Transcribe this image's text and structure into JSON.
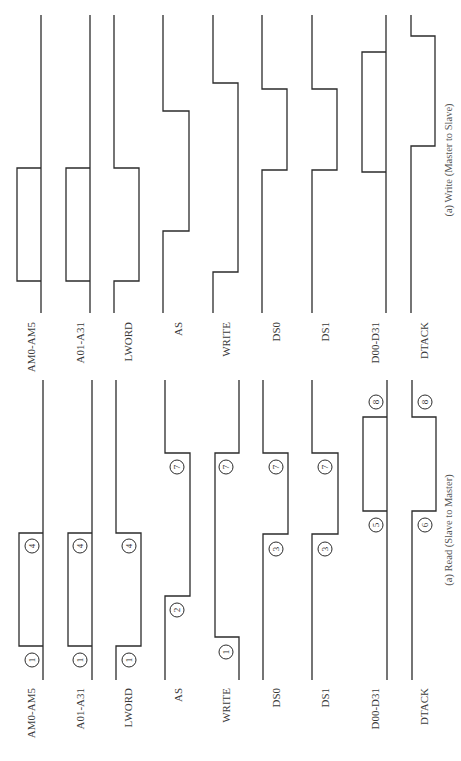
{
  "diagram": {
    "panels": [
      {
        "id": "write",
        "caption": "(a) Write (Master to Slave)",
        "caption_pos": [
          452,
          160
        ],
        "top_y": 15,
        "bottom_y": 313,
        "label_y": 322,
        "signals": [
          {
            "name": "AM0-AM5",
            "kind": "bus",
            "x": 41,
            "dx": -24,
            "segments": [
              [
                168,
                281
              ]
            ],
            "label_x": 31
          },
          {
            "name": "A01-A31",
            "kind": "bus",
            "x": 90,
            "dx": -24,
            "segments": [
              [
                168,
                281
              ]
            ],
            "label_x": 80
          },
          {
            "name": "LWORD",
            "kind": "step",
            "x": 114,
            "dx": 25,
            "segments": [
              [
                168,
                281
              ]
            ],
            "label_x": 128
          },
          {
            "name": "AS",
            "kind": "step",
            "x": 163,
            "dx": 26,
            "segments": [
              [
                111,
                231
              ]
            ],
            "label_x": 178
          },
          {
            "name": "WRITE",
            "kind": "step",
            "x": 213,
            "dx": 25,
            "segments": [
              [
                83,
                272
              ]
            ],
            "label_x": 226
          },
          {
            "name": "DS0",
            "kind": "step",
            "x": 262,
            "dx": 25,
            "segments": [
              [
                89,
                170
              ]
            ],
            "label_x": 276
          },
          {
            "name": "DS1",
            "kind": "step",
            "x": 312,
            "dx": 25,
            "segments": [
              [
                89,
                170
              ]
            ],
            "label_x": 325
          },
          {
            "name": "D00-D31",
            "kind": "bus",
            "x": 386,
            "dx": -24,
            "segments": [
              [
                52,
                172
              ]
            ],
            "label_x": 375
          },
          {
            "name": "DTACK",
            "kind": "step",
            "x": 411,
            "dx": 24,
            "segments": [
              [
                36,
                146
              ]
            ],
            "label_x": 424
          }
        ],
        "markers": []
      },
      {
        "id": "read",
        "caption": "(a) Read (Slave to Master)",
        "caption_pos": [
          452,
          530
        ],
        "top_y": 380,
        "bottom_y": 680,
        "label_y": 688,
        "signals": [
          {
            "name": "AM0-AM5",
            "kind": "bus",
            "x": 43,
            "dx": -24,
            "segments": [
              [
                533,
                646
              ]
            ],
            "label_x": 31
          },
          {
            "name": "A01-A31",
            "kind": "bus",
            "x": 92,
            "dx": -24,
            "segments": [
              [
                533,
                646
              ]
            ],
            "label_x": 80
          },
          {
            "name": "LWORD",
            "kind": "step",
            "x": 116,
            "dx": 25,
            "segments": [
              [
                533,
                646
              ]
            ],
            "label_x": 128
          },
          {
            "name": "AS",
            "kind": "step",
            "x": 165,
            "dx": 25,
            "segments": [
              [
                453,
                596
              ]
            ],
            "label_x": 178
          },
          {
            "name": "WRITE",
            "kind": "invstep",
            "x": 239,
            "dx": -24,
            "segments": [
              [
                453,
                637
              ]
            ],
            "label_x": 226
          },
          {
            "name": "DS0",
            "kind": "step",
            "x": 263,
            "dx": 25,
            "segments": [
              [
                453,
                534
              ]
            ],
            "label_x": 276
          },
          {
            "name": "DS1",
            "kind": "step",
            "x": 312,
            "dx": 26,
            "segments": [
              [
                453,
                534
              ]
            ],
            "label_x": 325
          },
          {
            "name": "D00-D31",
            "kind": "bus",
            "x": 387,
            "dx": -24,
            "segments": [
              [
                417,
                511
              ]
            ],
            "label_x": 375
          },
          {
            "name": "DTACK",
            "kind": "step",
            "x": 412,
            "dx": 24,
            "segments": [
              [
                417,
                511
              ]
            ],
            "label_x": 424
          }
        ],
        "markers": [
          {
            "n": "1",
            "x": 32,
            "y": 660
          },
          {
            "n": "4",
            "x": 32,
            "y": 546
          },
          {
            "n": "1",
            "x": 80,
            "y": 660
          },
          {
            "n": "4",
            "x": 80,
            "y": 546
          },
          {
            "n": "1",
            "x": 129,
            "y": 660
          },
          {
            "n": "4",
            "x": 129,
            "y": 546
          },
          {
            "n": "7",
            "x": 177,
            "y": 467
          },
          {
            "n": "2",
            "x": 177,
            "y": 610
          },
          {
            "n": "7",
            "x": 226,
            "y": 467
          },
          {
            "n": "1",
            "x": 226,
            "y": 652
          },
          {
            "n": "7",
            "x": 276,
            "y": 467
          },
          {
            "n": "3",
            "x": 276,
            "y": 549
          },
          {
            "n": "7",
            "x": 325,
            "y": 467
          },
          {
            "n": "3",
            "x": 325,
            "y": 549
          },
          {
            "n": "8",
            "x": 376,
            "y": 402
          },
          {
            "n": "5",
            "x": 376,
            "y": 525
          },
          {
            "n": "8",
            "x": 425,
            "y": 402
          },
          {
            "n": "6",
            "x": 425,
            "y": 525
          }
        ]
      }
    ]
  },
  "colors": {
    "line": "#2b2b2b",
    "text": "#3a3a3a",
    "background": "#ffffff"
  }
}
